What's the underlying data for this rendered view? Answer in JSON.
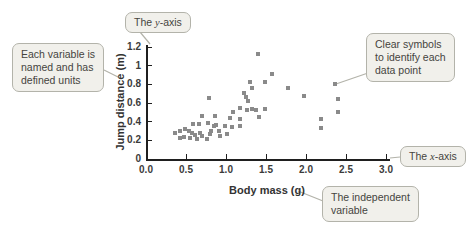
{
  "figure_type": "annotated scatter plot (textbook figure)",
  "chart_data": {
    "type": "scatter",
    "title": "",
    "xlabel": "Body mass (g)",
    "ylabel": "Jump distance (m)",
    "xlim": [
      0,
      3.0
    ],
    "ylim": [
      0,
      1.2
    ],
    "x_ticks": [
      "0.0",
      "0.5",
      "1.0",
      "1.5",
      "2.0",
      "2.5",
      "3.0"
    ],
    "y_ticks": [
      "0",
      "0.2",
      "0.4",
      "0.6",
      "0.8",
      "1",
      "1.2"
    ],
    "grid": false,
    "legend": "none",
    "marker": "square",
    "points": [
      [
        0.36,
        0.28
      ],
      [
        0.42,
        0.23
      ],
      [
        0.43,
        0.3
      ],
      [
        0.49,
        0.32
      ],
      [
        0.48,
        0.24
      ],
      [
        0.54,
        0.3
      ],
      [
        0.55,
        0.23
      ],
      [
        0.59,
        0.38
      ],
      [
        0.58,
        0.28
      ],
      [
        0.61,
        0.26
      ],
      [
        0.64,
        0.21
      ],
      [
        0.66,
        0.38
      ],
      [
        0.68,
        0.28
      ],
      [
        0.7,
        0.46
      ],
      [
        0.7,
        0.25
      ],
      [
        0.76,
        0.21
      ],
      [
        0.78,
        0.39
      ],
      [
        0.79,
        0.65
      ],
      [
        0.8,
        0.27
      ],
      [
        0.81,
        0.3
      ],
      [
        0.85,
        0.35
      ],
      [
        0.86,
        0.46
      ],
      [
        0.88,
        0.36
      ],
      [
        0.91,
        0.3
      ],
      [
        0.93,
        0.25
      ],
      [
        0.99,
        0.35
      ],
      [
        1.01,
        0.27
      ],
      [
        1.05,
        0.44
      ],
      [
        1.08,
        0.34
      ],
      [
        1.09,
        0.5
      ],
      [
        1.18,
        0.55
      ],
      [
        1.18,
        0.43
      ],
      [
        1.18,
        0.35
      ],
      [
        1.23,
        0.71
      ],
      [
        1.25,
        0.66
      ],
      [
        1.28,
        0.62
      ],
      [
        1.26,
        0.52
      ],
      [
        1.33,
        0.54
      ],
      [
        1.38,
        0.52
      ],
      [
        1.41,
        0.45
      ],
      [
        1.49,
        0.54
      ],
      [
        1.3,
        0.83
      ],
      [
        1.33,
        0.76
      ],
      [
        1.4,
        1.13
      ],
      [
        1.49,
        0.83
      ],
      [
        1.58,
        0.91
      ],
      [
        1.78,
        0.76
      ],
      [
        1.98,
        0.67
      ],
      [
        2.19,
        0.43
      ],
      [
        2.19,
        0.33
      ],
      [
        2.36,
        0.8
      ],
      [
        2.4,
        0.64
      ],
      [
        2.4,
        0.5
      ]
    ]
  },
  "callouts": {
    "y_axis": {
      "prefix": "The ",
      "variable": "y",
      "suffix": "-axis"
    },
    "x_axis": {
      "prefix": "The ",
      "variable": "x",
      "suffix": "-axis"
    },
    "each_variable": {
      "line1": "Each variable is",
      "line2": "named and has",
      "line3": "defined units"
    },
    "clear_symbols": {
      "line1": "Clear symbols",
      "line2": "to identify each",
      "line3": "data point"
    },
    "independent": {
      "line1": "The independent",
      "line2": "variable"
    }
  },
  "colors": {
    "marker": "#8a8a8a",
    "axis": "#1f1f1f",
    "callout_fill": "#f1f0eb",
    "callout_border": "#b3b3aa",
    "callout_text": "#45443e"
  }
}
